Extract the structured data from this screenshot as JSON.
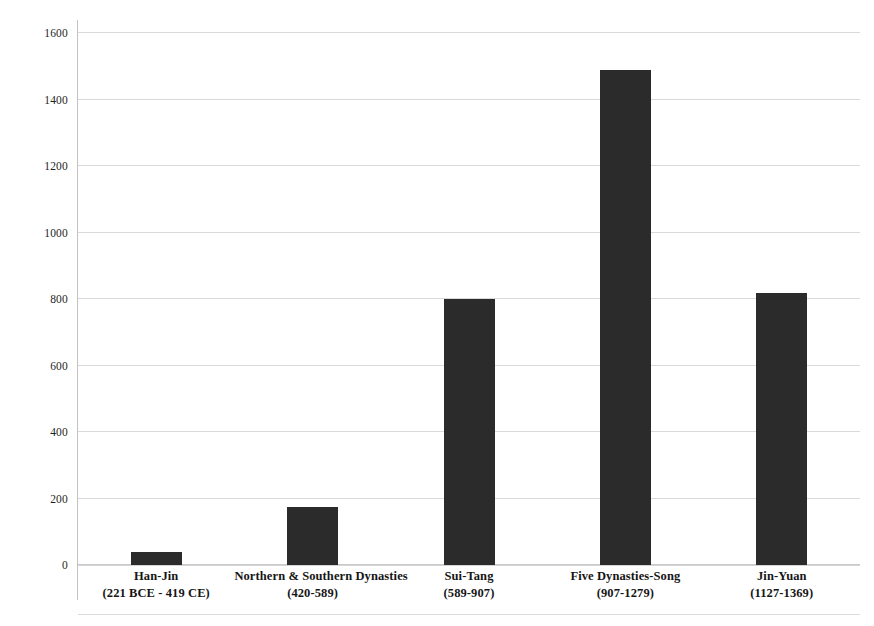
{
  "chart_data": {
    "type": "bar",
    "title": "",
    "subtitle": "",
    "xlabel": "",
    "ylabel": "",
    "ylim": [
      0,
      1600
    ],
    "ytick_step": 200,
    "yticks": [
      0,
      200,
      400,
      600,
      800,
      1000,
      1200,
      1400,
      1600
    ],
    "ytick_labels": [
      "0",
      "200",
      "400",
      "600",
      "800",
      "1000",
      "1200",
      "1400",
      "1600"
    ],
    "grid": true,
    "grid_axis": "y",
    "legend": false,
    "legend_position": "none",
    "bar_color": "#2b2b2b",
    "categories": [
      "Han-Jin",
      "Northern & Southern  Dynasties",
      "Sui-Tang",
      "Five Dynasties-Song",
      "Jin-Yuan"
    ],
    "category_ranges": [
      "(221 BCE - 419 CE)",
      "(420-589)",
      "(589-907)",
      "(907-1279)",
      "(1127-1369)"
    ],
    "values": [
      40,
      175,
      800,
      1490,
      818
    ],
    "series": [
      {
        "name": "count",
        "values": [
          40,
          175,
          800,
          1490,
          818
        ]
      }
    ]
  },
  "axis": {
    "y_line_color": "#c2c2c2",
    "grid_color": "#d9d9d9"
  }
}
